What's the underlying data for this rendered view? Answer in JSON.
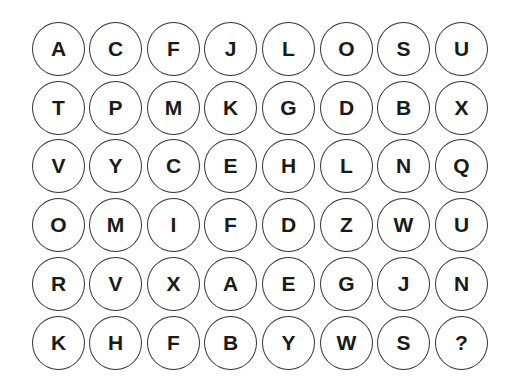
{
  "puzzle": {
    "columns": 8,
    "rows": 6,
    "cells": [
      [
        "A",
        "C",
        "F",
        "J",
        "L",
        "O",
        "S",
        "U"
      ],
      [
        "T",
        "P",
        "M",
        "K",
        "G",
        "D",
        "B",
        "X"
      ],
      [
        "V",
        "Y",
        "C",
        "E",
        "H",
        "L",
        "N",
        "Q"
      ],
      [
        "O",
        "M",
        "I",
        "F",
        "D",
        "Z",
        "W",
        "U"
      ],
      [
        "R",
        "V",
        "X",
        "A",
        "E",
        "G",
        "J",
        "N"
      ],
      [
        "K",
        "H",
        "F",
        "B",
        "Y",
        "W",
        "S",
        "?"
      ]
    ],
    "missing_marker": "?"
  },
  "colors": {
    "background": "#ffffff",
    "circle_border": "#333333",
    "letter": "#1a1a1a"
  }
}
